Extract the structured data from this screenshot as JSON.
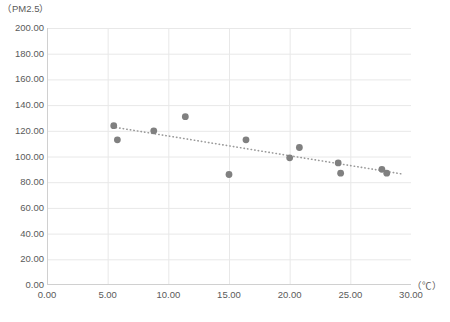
{
  "chart_data": {
    "type": "scatter",
    "title": "",
    "ylabel": "（PM2.5）",
    "xlabel": "（℃）",
    "xlim": [
      0,
      30
    ],
    "ylim": [
      0,
      200
    ],
    "xticks": [
      "0.00",
      "5.00",
      "10.00",
      "15.00",
      "20.00",
      "25.00",
      "30.00"
    ],
    "xtick_values": [
      0,
      5,
      10,
      15,
      20,
      25,
      30
    ],
    "yticks": [
      "0.00",
      "20.00",
      "40.00",
      "60.00",
      "80.00",
      "100.00",
      "120.00",
      "140.00",
      "160.00",
      "180.00",
      "200.00"
    ],
    "ytick_values": [
      0,
      20,
      40,
      60,
      80,
      100,
      120,
      140,
      160,
      180,
      200
    ],
    "grid": true,
    "legend": null,
    "series": [
      {
        "name": "PM2.5 vs Temperature",
        "marker": "circle",
        "color": "#808080",
        "points": [
          {
            "x": 5.5,
            "y": 124.0
          },
          {
            "x": 5.8,
            "y": 113.0
          },
          {
            "x": 8.8,
            "y": 120.0
          },
          {
            "x": 11.4,
            "y": 131.0
          },
          {
            "x": 15.0,
            "y": 86.0
          },
          {
            "x": 16.4,
            "y": 113.0
          },
          {
            "x": 20.0,
            "y": 99.0
          },
          {
            "x": 20.8,
            "y": 107.0
          },
          {
            "x": 24.0,
            "y": 95.0
          },
          {
            "x": 24.2,
            "y": 87.0
          },
          {
            "x": 27.6,
            "y": 90.0
          },
          {
            "x": 28.0,
            "y": 87.0
          }
        ]
      }
    ],
    "trendline": {
      "type": "linear",
      "style": "dotted",
      "color": "#9a9a9a",
      "x_start": 5.4,
      "y_start": 123.0,
      "x_end": 29.2,
      "y_end": 86.5
    },
    "colors": {
      "marker": "#808080",
      "trendline": "#9a9a9a",
      "grid": "#e8e8e8",
      "axis": "#d0d0d0",
      "text": "#5a5a5a",
      "background": "#ffffff"
    }
  }
}
